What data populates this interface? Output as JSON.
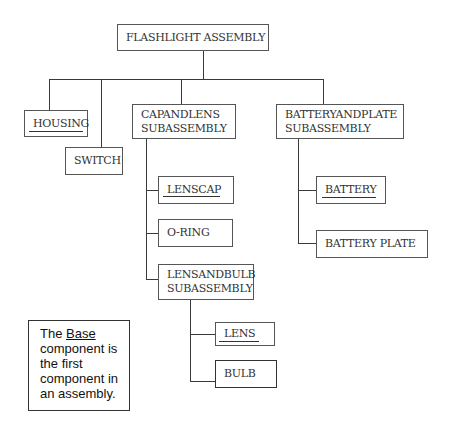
{
  "diagram": {
    "root": {
      "label": "FLASHLIGHT ASSEMBLY"
    },
    "level1": [
      {
        "id": "housing",
        "label": "HOUSING",
        "is_base": true
      },
      {
        "id": "switch",
        "label": "SWITCH",
        "is_base": false
      },
      {
        "id": "cap_and_lens",
        "line1": "CAPANDLENS",
        "line2": "SUBASSEMBLY",
        "is_base": false
      },
      {
        "id": "battery_and_plate",
        "line1": "BATTERYANDPLATE",
        "line2": "SUBASSEMBLY",
        "is_base": false
      }
    ],
    "cap_and_lens_children": [
      {
        "id": "lenscap",
        "label": "LENSCAP",
        "is_base": true
      },
      {
        "id": "o_ring",
        "label": "O-RING",
        "is_base": false
      },
      {
        "id": "lens_and_bulb",
        "line1": "LENSANDBULB",
        "line2": "SUBASSEMBLY",
        "is_base": false
      }
    ],
    "lens_and_bulb_children": [
      {
        "id": "lens",
        "label": "LENS",
        "is_base": true
      },
      {
        "id": "bulb",
        "label": "BULB",
        "is_base": false
      }
    ],
    "battery_and_plate_children": [
      {
        "id": "battery",
        "label": "BATTERY",
        "is_base": true
      },
      {
        "id": "battery_plate",
        "label": "BATTERY PLATE",
        "is_base": false
      }
    ]
  },
  "note": {
    "prefix": "The ",
    "emphasis": "Base",
    "line2": "component is",
    "line3": "the first",
    "line4": "component in",
    "line5": "an assembly."
  },
  "colors": {
    "line": "#3a3a3a",
    "border": "#555555",
    "text": "#333333"
  }
}
